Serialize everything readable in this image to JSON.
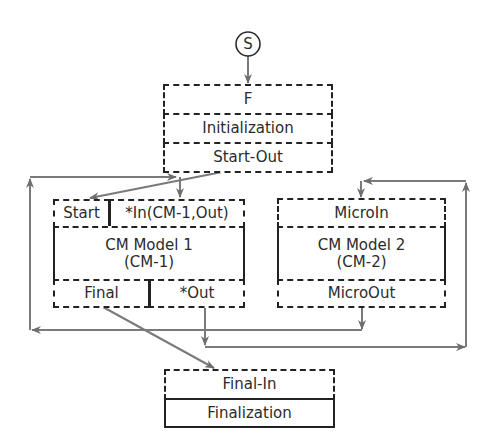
{
  "start_node": {
    "label": "S"
  },
  "colors": {
    "box_border": "#222222",
    "connector": "#7a7a7a",
    "text": "#2b2b2b"
  },
  "boxes": {
    "init": {
      "rows": [
        "F",
        "Initialization",
        "Start-Out"
      ]
    },
    "cm1": {
      "top_left": "Start",
      "top_right": "*In(CM-1,Out)",
      "title_line1": "CM Model 1",
      "title_line2": "(CM-1)",
      "bottom_left": "Final",
      "bottom_right": "*Out"
    },
    "cm2": {
      "top": "MicroIn",
      "title_line1": "CM Model 2",
      "title_line2": "(CM-2)",
      "bottom": "MicroOut"
    },
    "final": {
      "rows": [
        "Final-In",
        "Finalization"
      ]
    }
  }
}
